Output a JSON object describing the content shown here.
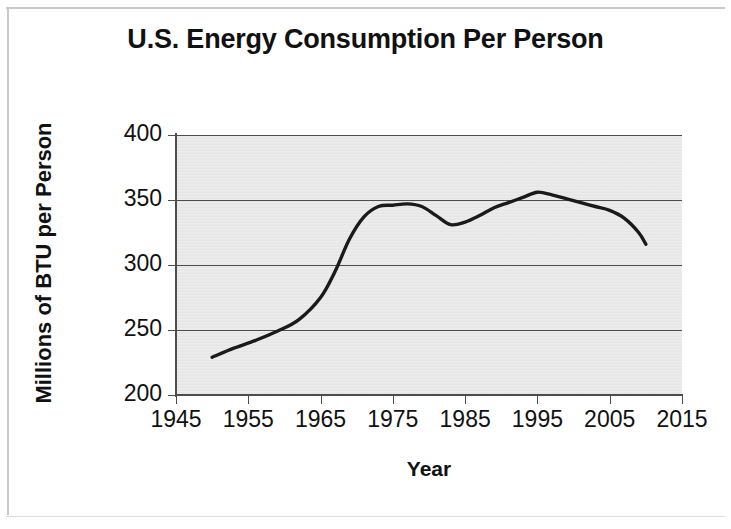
{
  "chart_data": {
    "type": "line",
    "title": "U.S. Energy Consumption Per Person",
    "xlabel": "Year",
    "ylabel": "Millions of BTU per Person",
    "xlim": [
      1945,
      2015
    ],
    "ylim": [
      200,
      400
    ],
    "xticks": [
      1945,
      1955,
      1965,
      1975,
      1985,
      1995,
      2005,
      2015
    ],
    "yticks": [
      200,
      250,
      300,
      350,
      400
    ],
    "grid": "horizontal",
    "legend": null,
    "line_color": "#1a1a1a",
    "plot_background": "#e9e9e9",
    "series": [
      {
        "name": "U.S. energy consumption per person",
        "x": [
          1950,
          1953,
          1956,
          1959,
          1962,
          1965,
          1967,
          1969,
          1971,
          1973,
          1975,
          1977,
          1979,
          1981,
          1983,
          1985,
          1987,
          1989,
          1991,
          1993,
          1995,
          1997,
          1999,
          2001,
          2003,
          2005,
          2007,
          2009,
          2010
        ],
        "values": [
          229,
          236,
          242,
          249,
          258,
          275,
          295,
          320,
          337,
          345,
          346,
          347,
          345,
          338,
          331,
          333,
          338,
          344,
          348,
          352,
          356,
          354,
          351,
          348,
          345,
          342,
          336,
          325,
          316
        ]
      }
    ]
  },
  "axes": {
    "y_tick_labels": [
      "400",
      "350",
      "300",
      "250",
      "200"
    ],
    "x_tick_labels": [
      "1945",
      "1955",
      "1965",
      "1975",
      "1985",
      "1995",
      "2005",
      "2015"
    ]
  }
}
